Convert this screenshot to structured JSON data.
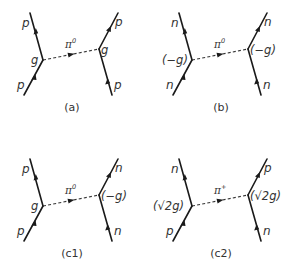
{
  "diagrams": [
    {
      "id": "a",
      "caption": "(a)",
      "left": {
        "top_particle": "p",
        "bottom_particle": "p",
        "coupling": "g"
      },
      "right": {
        "top_particle": "p",
        "bottom_particle": "p",
        "coupling": "g"
      },
      "exchange": {
        "symbol": "π",
        "charge": "0"
      }
    },
    {
      "id": "b",
      "caption": "(b)",
      "left": {
        "top_particle": "n",
        "bottom_particle": "n",
        "coupling": "(−g)"
      },
      "right": {
        "top_particle": "n",
        "bottom_particle": "n",
        "coupling": "(−g)"
      },
      "exchange": {
        "symbol": "π",
        "charge": "0"
      }
    },
    {
      "id": "c1",
      "caption": "(c1)",
      "left": {
        "top_particle": "p",
        "bottom_particle": "p",
        "coupling": "g"
      },
      "right": {
        "top_particle": "n",
        "bottom_particle": "n",
        "coupling": "(−g)"
      },
      "exchange": {
        "symbol": "π",
        "charge": "0"
      }
    },
    {
      "id": "c2",
      "caption": "(c2)",
      "left": {
        "top_particle": "n",
        "bottom_particle": "p",
        "coupling": "(√2g)"
      },
      "right": {
        "top_particle": "p",
        "bottom_particle": "n",
        "coupling": "(√2g)"
      },
      "exchange": {
        "symbol": "π",
        "charge": "+"
      }
    }
  ],
  "colors": {
    "line": "#1a1a1a",
    "text": "#333333",
    "background": "#ffffff"
  }
}
